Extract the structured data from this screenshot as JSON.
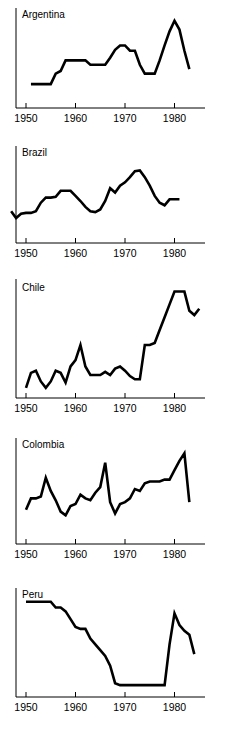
{
  "figure": {
    "name": "small-multiples-line-charts",
    "background_color": "#ffffff",
    "line_color": "#000000",
    "axis_color": "#000000",
    "panel_count": 5
  },
  "chart_data": [
    {
      "type": "line",
      "title": "Argentina",
      "xlabel": "",
      "ylabel": "",
      "xlim": [
        1948,
        1986
      ],
      "ylim": [
        0,
        100
      ],
      "grid": false,
      "legend": "none",
      "xticks": [
        1950,
        1960,
        1970,
        1980
      ],
      "xtick_labels": [
        "1950",
        "1960",
        "1970",
        "1980"
      ],
      "yticks": [],
      "ytick_labels": [],
      "x": [
        1951,
        1952,
        1953,
        1954,
        1955,
        1956,
        1957,
        1958,
        1959,
        1960,
        1961,
        1962,
        1963,
        1964,
        1965,
        1966,
        1967,
        1968,
        1969,
        1970,
        1971,
        1972,
        1973,
        1974,
        1975,
        1976,
        1977,
        1978,
        1979,
        1980,
        1981,
        1982,
        1983
      ],
      "values": [
        18,
        18,
        18,
        18,
        18,
        30,
        33,
        45,
        45,
        45,
        45,
        45,
        40,
        40,
        40,
        40,
        48,
        57,
        62,
        62,
        56,
        56,
        40,
        30,
        30,
        30,
        45,
        62,
        78,
        90,
        80,
        56,
        35
      ]
    },
    {
      "type": "line",
      "title": "Brazil",
      "xlabel": "",
      "ylabel": "",
      "xlim": [
        1946,
        1984
      ],
      "ylim": [
        0,
        100
      ],
      "grid": false,
      "legend": "none",
      "xticks": [
        1950,
        1960,
        1970,
        1980
      ],
      "xtick_labels": [
        "1950",
        "1960",
        "1970",
        "1980"
      ],
      "yticks": [],
      "ytick_labels": [],
      "x": [
        1947,
        1948,
        1949,
        1950,
        1951,
        1952,
        1953,
        1954,
        1955,
        1956,
        1957,
        1958,
        1959,
        1960,
        1961,
        1962,
        1963,
        1964,
        1965,
        1966,
        1967,
        1968,
        1969,
        1970,
        1971,
        1972,
        1973,
        1974,
        1975,
        1976,
        1977,
        1978,
        1979,
        1980,
        1981
      ],
      "values": [
        28,
        20,
        25,
        26,
        26,
        28,
        38,
        44,
        44,
        45,
        52,
        52,
        52,
        46,
        40,
        33,
        28,
        27,
        30,
        40,
        55,
        50,
        58,
        62,
        68,
        75,
        76,
        68,
        58,
        46,
        38,
        35,
        42,
        42,
        42
      ]
    },
    {
      "type": "line",
      "title": "Chile",
      "xlabel": "",
      "ylabel": "",
      "xlim": [
        1948,
        1988
      ],
      "ylim": [
        0,
        100
      ],
      "grid": false,
      "legend": "none",
      "xticks": [
        1950,
        1960,
        1970,
        1980
      ],
      "xtick_labels": [
        "1950",
        "1960",
        "1970",
        "1980"
      ],
      "yticks": [],
      "ytick_labels": [],
      "x": [
        1950,
        1951,
        1952,
        1953,
        1954,
        1955,
        1956,
        1957,
        1958,
        1959,
        1960,
        1961,
        1962,
        1963,
        1964,
        1965,
        1966,
        1967,
        1968,
        1969,
        1970,
        1971,
        1972,
        1973,
        1974,
        1975,
        1976,
        1977,
        1978,
        1979,
        1980,
        1981,
        1982,
        1983,
        1984,
        1985
      ],
      "values": [
        2,
        16,
        18,
        8,
        2,
        8,
        18,
        16,
        7,
        22,
        28,
        42,
        22,
        14,
        14,
        14,
        17,
        14,
        20,
        22,
        18,
        13,
        10,
        10,
        42,
        42,
        44,
        56,
        68,
        80,
        92,
        92,
        92,
        74,
        70,
        76
      ]
    },
    {
      "type": "line",
      "title": "Colombia",
      "xlabel": "",
      "ylabel": "",
      "xlim": [
        1948,
        1986
      ],
      "ylim": [
        0,
        100
      ],
      "grid": false,
      "legend": "none",
      "xticks": [
        1950,
        1960,
        1970,
        1980
      ],
      "xtick_labels": [
        "1950",
        "1960",
        "1970",
        "1980"
      ],
      "yticks": [],
      "ytick_labels": [],
      "x": [
        1950,
        1951,
        1952,
        1953,
        1954,
        1955,
        1956,
        1957,
        1958,
        1959,
        1960,
        1961,
        1962,
        1963,
        1964,
        1965,
        1966,
        1967,
        1968,
        1969,
        1970,
        1971,
        1972,
        1973,
        1974,
        1975,
        1976,
        1977,
        1978,
        1979,
        1980,
        1981,
        1982,
        1983
      ],
      "values": [
        28,
        40,
        40,
        42,
        62,
        48,
        38,
        26,
        22,
        32,
        34,
        44,
        40,
        38,
        46,
        52,
        78,
        36,
        24,
        34,
        36,
        40,
        50,
        48,
        56,
        58,
        58,
        58,
        60,
        60,
        70,
        80,
        88,
        36
      ]
    },
    {
      "type": "line",
      "title": "Peru",
      "xlabel": "",
      "ylabel": "",
      "xlim": [
        1948,
        1986
      ],
      "ylim": [
        0,
        100
      ],
      "grid": false,
      "legend": "none",
      "xticks": [
        1950,
        1960,
        1970,
        1980
      ],
      "xtick_labels": [
        "1950",
        "1960",
        "1970",
        "1980"
      ],
      "yticks": [],
      "ytick_labels": [],
      "x": [
        1950,
        1951,
        1952,
        1953,
        1954,
        1955,
        1956,
        1957,
        1958,
        1959,
        1960,
        1961,
        1962,
        1963,
        1964,
        1965,
        1966,
        1967,
        1968,
        1969,
        1970,
        1971,
        1972,
        1973,
        1974,
        1975,
        1976,
        1977,
        1978,
        1979,
        1980,
        1981,
        1982,
        1983,
        1984
      ],
      "values": [
        90,
        90,
        90,
        90,
        90,
        90,
        84,
        84,
        80,
        72,
        64,
        62,
        62,
        52,
        46,
        40,
        34,
        24,
        6,
        4,
        4,
        4,
        4,
        4,
        4,
        4,
        4,
        4,
        4,
        46,
        78,
        66,
        60,
        56,
        36
      ]
    }
  ]
}
